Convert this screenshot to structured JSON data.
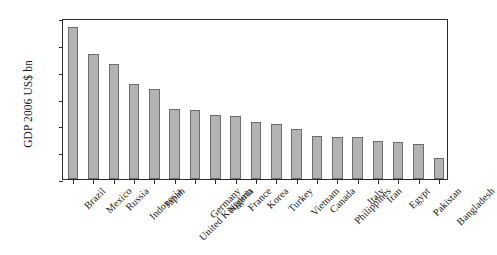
{
  "chart_data": {
    "type": "bar",
    "title": "",
    "xlabel": "",
    "ylabel": "GDP 2006 US$ bn",
    "ylim": [
      0,
      12000
    ],
    "yticks": [
      0,
      2000,
      4000,
      6000,
      8000,
      10000,
      12000
    ],
    "ytick_labels": [
      "0",
      "2,000",
      "4,000",
      "6,000",
      "8,000",
      "10,000",
      "12,000"
    ],
    "grid": false,
    "legend": null,
    "bar_color": "#b3b3b3",
    "bar_edge_color": "#6d6d6d",
    "axis_color": "#2b2b2b",
    "categories": [
      "Brazil",
      "Mexico",
      "Russia",
      "Indonesia",
      "Japan",
      "United Kingdom",
      "Germany",
      "Nigeria",
      "France",
      "Korea",
      "Turkey",
      "Vietnam",
      "Canada",
      "Philippines",
      "Italy",
      "Iran",
      "Egypt",
      "Pakistan",
      "Bangladesh"
    ],
    "values": [
      11300,
      9350,
      8550,
      7100,
      6700,
      5200,
      5150,
      4750,
      4700,
      4250,
      4100,
      3700,
      3200,
      3150,
      3100,
      2850,
      2750,
      2600,
      1600
    ]
  }
}
